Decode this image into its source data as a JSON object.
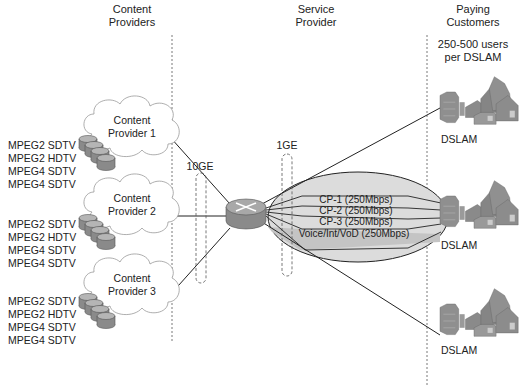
{
  "sections": {
    "content_providers": [
      "Content",
      "Providers"
    ],
    "service_provider": [
      "Service",
      "Provider"
    ],
    "paying_customers": [
      "Paying",
      "Customers"
    ]
  },
  "users_note": [
    "250-500 users",
    "per DSLAM"
  ],
  "providers": [
    {
      "label": [
        "Content",
        "Provider 1"
      ],
      "formats": [
        "MPEG2 SDTV",
        "MPEG2 HDTV",
        "MPEG4 SDTV",
        "MPEG4 SDTV"
      ]
    },
    {
      "label": [
        "Content",
        "Provider 2"
      ],
      "formats": [
        "MPEG2 SDTV",
        "MPEG2 HDTV",
        "MPEG4 SDTV",
        "MPEG4 SDTV"
      ]
    },
    {
      "label": [
        "Content",
        "Provider 3"
      ],
      "formats": [
        "MPEG2 SDTV",
        "MPEG2 HDTV",
        "MPEG4 SDTV",
        "MPEG4 SDTV"
      ]
    }
  ],
  "links": {
    "provider_link": "10GE",
    "customer_link": "1GE"
  },
  "channels": [
    "CP-1  (250Mbps)",
    "CP-2  (250Mbps)",
    "CP-3  (250Mbps)",
    "Voice/Int/VoD (250Mbps)"
  ],
  "dslams": [
    "DSLAM",
    "DSLAM",
    "DSLAM"
  ],
  "colors": {
    "cloud_fill": "#ffffff",
    "ellipse_fill": "#dcdcdc",
    "voice_band": "#c4c4c4",
    "icon_gray": "#8a8a8a",
    "line": "#222222"
  }
}
